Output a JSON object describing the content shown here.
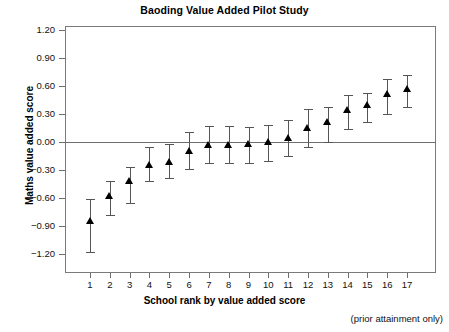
{
  "chart_data": {
    "type": "scatter",
    "title": "Baoding Value Added Pilot Study",
    "xlabel": "School rank by value added score",
    "ylabel": "Maths value added score",
    "footnote": "(prior attainment only)",
    "grid": false,
    "legend": "none",
    "xlim": [
      0.3,
      17.7
    ],
    "ylim": [
      -1.35,
      1.35
    ],
    "yticks": [
      "1.20",
      "0.90",
      "0.60",
      "0.30",
      "0.00",
      "-0.60",
      "-0.30",
      "-0.90",
      "-1.20"
    ],
    "ytick_values": [
      1.2,
      0.9,
      0.6,
      0.3,
      0.0,
      -0.3,
      -0.6,
      -0.9,
      -1.2
    ],
    "ytick_labels": [
      "1.20",
      "0.90",
      "0.60",
      "0.30",
      "0.00",
      "−0.30",
      "−0.60",
      "−0.90",
      "−1.20"
    ],
    "categories": [
      "1",
      "2",
      "3",
      "4",
      "5",
      "6",
      "7",
      "8",
      "9",
      "10",
      "11",
      "12",
      "13",
      "14",
      "15",
      "16",
      "17"
    ],
    "x": [
      1,
      2,
      3,
      4,
      5,
      6,
      7,
      8,
      9,
      10,
      11,
      12,
      13,
      14,
      15,
      16,
      17
    ],
    "values": [
      -0.85,
      -0.58,
      -0.42,
      -0.25,
      -0.21,
      -0.1,
      -0.03,
      -0.03,
      -0.02,
      0.0,
      0.04,
      0.15,
      0.21,
      0.34,
      0.4,
      0.51,
      0.57
    ],
    "ci_low": [
      -1.18,
      -0.78,
      -0.65,
      -0.42,
      -0.39,
      -0.29,
      -0.23,
      -0.22,
      -0.23,
      -0.2,
      -0.15,
      -0.05,
      0.0,
      0.14,
      0.21,
      0.3,
      0.38
    ],
    "ci_high": [
      -0.61,
      -0.42,
      -0.27,
      -0.05,
      -0.02,
      0.11,
      0.17,
      0.17,
      0.16,
      0.18,
      0.24,
      0.35,
      0.38,
      0.5,
      0.52,
      0.68,
      0.72
    ],
    "marker": "triangle",
    "marker_color": "#000000",
    "errorbar_color": "#555555",
    "zero_line": 0.0,
    "axis_color": "#7a7a7a"
  }
}
